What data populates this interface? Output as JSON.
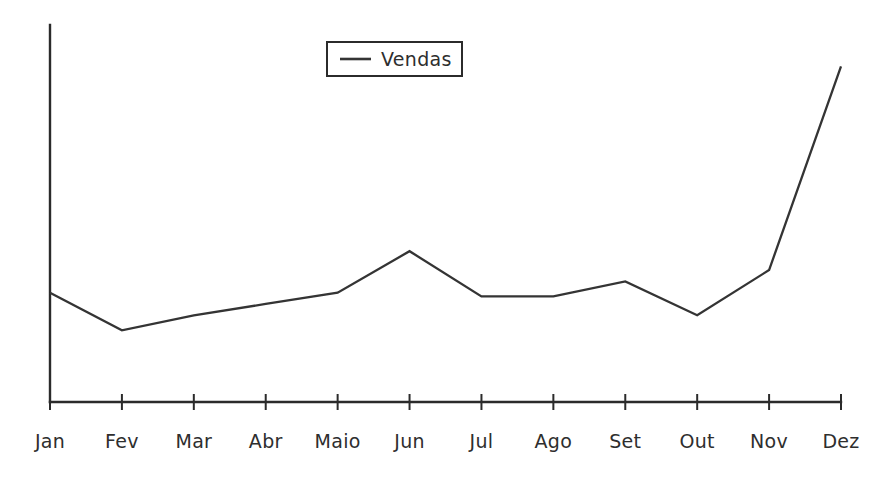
{
  "chart_data": {
    "type": "line",
    "title": "",
    "xlabel": "",
    "ylabel": "",
    "grid": false,
    "legend_position": "top-center",
    "categories": [
      "Jan",
      "Fev",
      "Mar",
      "Abr",
      "Maio",
      "Jun",
      "Jul",
      "Ago",
      "Set",
      "Out",
      "Nov",
      "Dez"
    ],
    "series": [
      {
        "name": "Vendas",
        "color": "#343434",
        "values": [
          29,
          19,
          23,
          26,
          29,
          40,
          28,
          28,
          32,
          23,
          35,
          89
        ]
      }
    ],
    "ylim": [
      0,
      100
    ],
    "y_axis_ticks_visible": false,
    "x_axis_ticks_visible": true
  },
  "legend": {
    "entries": [
      {
        "label": "Vendas",
        "marker": "line-sample"
      }
    ]
  },
  "axis": {
    "x_tick_labels": [
      "Jan",
      "Fev",
      "Mar",
      "Abr",
      "Maio",
      "Jun",
      "Jul",
      "Ago",
      "Set",
      "Out",
      "Nov",
      "Dez"
    ]
  },
  "colors": {
    "series": "#343434",
    "axis": "#2b2b2b",
    "text": "#2e2e2e",
    "background": "#ffffff"
  }
}
